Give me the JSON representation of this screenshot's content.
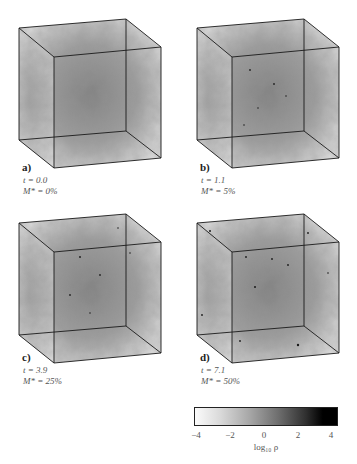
{
  "figure": {
    "panels": [
      {
        "letter": "a)",
        "t_label": "t = 0.0",
        "m_label": "M* = 0%"
      },
      {
        "letter": "b)",
        "t_label": "t = 1.1",
        "m_label": "M* = 5%"
      },
      {
        "letter": "c)",
        "t_label": "t = 3.9",
        "m_label": "M* = 25%"
      },
      {
        "letter": "d)",
        "t_label": "t = 7.1",
        "m_label": "M* = 50%"
      }
    ],
    "colorbar": {
      "ticks": [
        "−4",
        "−2",
        "0",
        "2",
        "4"
      ],
      "label": "log₁₀ ρ",
      "range": [
        -4,
        4.5
      ],
      "colormap": "white-to-black"
    }
  }
}
